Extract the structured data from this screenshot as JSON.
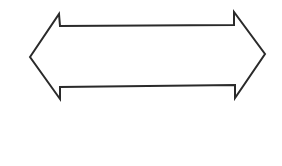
{
  "diagram": {
    "shape": "double-headed-arrow",
    "stroke_color": "#2a2a2a",
    "fill_color": "#ffffff",
    "stroke_width": 2,
    "points": "30,57 59,14 60,26 234,25 234,12 265,54 235,98 235,85 60,87 60,99"
  }
}
